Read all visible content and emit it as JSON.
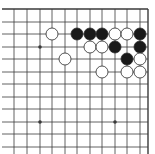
{
  "board": {
    "description": "Go board corner diagram (top-right corner)",
    "colors": {
      "background": "#ffffff",
      "line": "#3a3a3a",
      "black_stone": "#1a1a1a",
      "white_stone": "#ffffff",
      "stone_outline": "#2a2a2a"
    },
    "grid": {
      "x_lines": [
        14,
        27,
        40,
        52,
        65,
        77,
        90,
        102,
        115,
        127,
        140
      ],
      "y_lines": [
        22,
        34,
        47,
        59,
        72,
        84,
        97,
        109,
        122,
        134,
        147
      ],
      "top_edge_y": 9,
      "right_edge_x": 148,
      "left_x": 2,
      "bottom_y": 154
    },
    "star_points": [
      {
        "x": 40,
        "y": 47
      },
      {
        "x": 40,
        "y": 122
      },
      {
        "x": 115,
        "y": 122
      }
    ],
    "stones": [
      {
        "color": "white",
        "x": 52,
        "y": 34
      },
      {
        "color": "black",
        "x": 77,
        "y": 34
      },
      {
        "color": "black",
        "x": 90,
        "y": 34
      },
      {
        "color": "black",
        "x": 102,
        "y": 34
      },
      {
        "color": "white",
        "x": 115,
        "y": 34
      },
      {
        "color": "white",
        "x": 127,
        "y": 34
      },
      {
        "color": "black",
        "x": 140,
        "y": 34
      },
      {
        "color": "white",
        "x": 90,
        "y": 47
      },
      {
        "color": "white",
        "x": 102,
        "y": 47
      },
      {
        "color": "black",
        "x": 115,
        "y": 47
      },
      {
        "color": "black",
        "x": 140,
        "y": 47
      },
      {
        "color": "white",
        "x": 65,
        "y": 59
      },
      {
        "color": "black",
        "x": 127,
        "y": 59
      },
      {
        "color": "white",
        "x": 140,
        "y": 59
      },
      {
        "color": "white",
        "x": 102,
        "y": 72
      },
      {
        "color": "white",
        "x": 127,
        "y": 72
      },
      {
        "color": "white",
        "x": 140,
        "y": 72
      }
    ],
    "stone_radius": 6
  }
}
